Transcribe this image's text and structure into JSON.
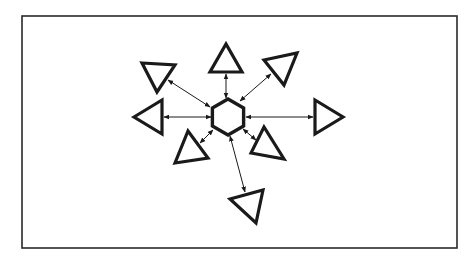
{
  "diagram": {
    "title": "",
    "colors": {
      "stroke": "#1a1a1a",
      "background": "#ffffff",
      "frame": "#2a2a2a"
    },
    "frame": {
      "x": 22,
      "y": 16,
      "width": 435,
      "height": 232
    },
    "hub": {
      "shape": "hexagon",
      "cx": 228,
      "cy": 117,
      "r": 18
    },
    "nodes": [
      {
        "id": "top",
        "shape": "triangle",
        "points": "210,72 242,72 226,44"
      },
      {
        "id": "top-left",
        "shape": "triangle",
        "points": "142,63 175,65 157,92"
      },
      {
        "id": "top-right",
        "shape": "triangle",
        "points": "264,60 297,53 284,85"
      },
      {
        "id": "left",
        "shape": "triangle",
        "points": "134,117 162,100 162,134"
      },
      {
        "id": "right",
        "shape": "triangle",
        "points": "315,100 315,134 343,117"
      },
      {
        "id": "bottom-left",
        "shape": "triangle",
        "points": "175,163 208,158 188,131"
      },
      {
        "id": "bottom-right",
        "shape": "triangle",
        "points": "251,153 284,159 264,127"
      },
      {
        "id": "bottom",
        "shape": "triangle",
        "points": "230,199 263,190 256,223"
      }
    ],
    "links": [
      {
        "to": "top",
        "x1": 226,
        "y1": 98,
        "x2": 226,
        "y2": 74,
        "direction": "bidirectional"
      },
      {
        "to": "top-left",
        "x1": 210,
        "y1": 107,
        "x2": 168,
        "y2": 80,
        "direction": "bidirectional"
      },
      {
        "to": "top-right",
        "x1": 240,
        "y1": 101,
        "x2": 271,
        "y2": 74,
        "direction": "bidirectional"
      },
      {
        "to": "left",
        "x1": 211,
        "y1": 117,
        "x2": 164,
        "y2": 117,
        "direction": "bidirectional"
      },
      {
        "to": "right",
        "x1": 246,
        "y1": 117,
        "x2": 313,
        "y2": 117,
        "direction": "bidirectional"
      },
      {
        "to": "bottom-left",
        "x1": 213,
        "y1": 130,
        "x2": 200,
        "y2": 143,
        "direction": "bidirectional"
      },
      {
        "to": "bottom-right",
        "x1": 243,
        "y1": 129,
        "x2": 256,
        "y2": 140,
        "direction": "bidirectional"
      },
      {
        "to": "bottom",
        "x1": 230,
        "y1": 136,
        "x2": 245,
        "y2": 192,
        "direction": "bidirectional"
      }
    ]
  }
}
